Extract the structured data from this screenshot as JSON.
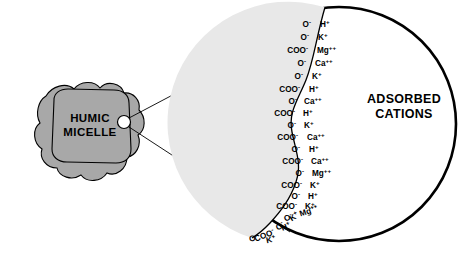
{
  "diagram": {
    "title_text": "",
    "micelle": {
      "line1": "HUMIC",
      "line2": "MICELLE",
      "fill_color": "#a8a8a8",
      "stroke_color": "#000000"
    },
    "magnifier": {
      "interior_fill": "#e8e8e8",
      "exterior_fill": "#ffffff",
      "stroke_color": "#000000",
      "callout_circle_name": "magnification-source-circle"
    },
    "adsorbed_heading": {
      "line1": "ADSORBED",
      "line2": "CATIONS"
    },
    "surface_pairs": [
      {
        "anion": "O",
        "anion_charge": "-",
        "cation": "H",
        "cation_charge": "+"
      },
      {
        "anion": "O",
        "anion_charge": "-",
        "cation": "K",
        "cation_charge": "+"
      },
      {
        "anion": "COO",
        "anion_charge": "-",
        "cation": "Mg",
        "cation_charge": "++"
      },
      {
        "anion": "O",
        "anion_charge": "-",
        "cation": "Ca",
        "cation_charge": "++"
      },
      {
        "anion": "O",
        "anion_charge": "-",
        "cation": "K",
        "cation_charge": "+"
      },
      {
        "anion": "COO",
        "anion_charge": "-",
        "cation": "H",
        "cation_charge": "+"
      },
      {
        "anion": "O",
        "anion_charge": "-",
        "cation": "Ca",
        "cation_charge": "++"
      },
      {
        "anion": "COO",
        "anion_charge": "-",
        "cation": "H",
        "cation_charge": "+"
      },
      {
        "anion": "O",
        "anion_charge": "-",
        "cation": "K",
        "cation_charge": "+"
      },
      {
        "anion": "COO",
        "anion_charge": "-",
        "cation": "Ca",
        "cation_charge": "++"
      },
      {
        "anion": "O",
        "anion_charge": "-",
        "cation": "H",
        "cation_charge": "+"
      },
      {
        "anion": "COO",
        "anion_charge": "-",
        "cation": "Ca",
        "cation_charge": "++"
      },
      {
        "anion": "O",
        "anion_charge": "-",
        "cation": "Mg",
        "cation_charge": "++"
      },
      {
        "anion": "COO",
        "anion_charge": "-",
        "cation": "K",
        "cation_charge": "+"
      },
      {
        "anion": "O",
        "anion_charge": "-",
        "cation": "H",
        "cation_charge": "+"
      },
      {
        "anion": "COO",
        "anion_charge": "-",
        "cation": "K",
        "cation_charge": "+"
      },
      {
        "anion": "O",
        "anion_charge": "-",
        "cation": "Mg",
        "cation_charge": "++"
      },
      {
        "anion": "O",
        "anion_charge": "-",
        "cation": "K",
        "cation_charge": "+"
      },
      {
        "anion": "COO",
        "anion_charge": "-",
        "cation": "H",
        "cation_charge": "+"
      },
      {
        "anion": "O",
        "anion_charge": "-",
        "cation": "K",
        "cation_charge": "+"
      }
    ]
  }
}
